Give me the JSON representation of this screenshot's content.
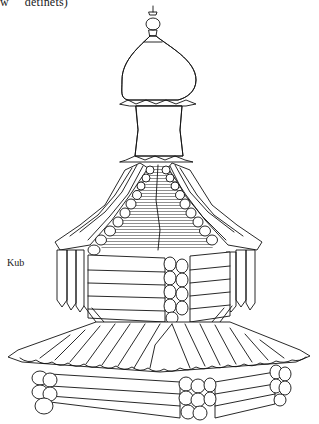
{
  "figure": {
    "caption_top": "w     detinets)",
    "labels": [
      {
        "id": "kub",
        "text": "Kub"
      }
    ],
    "colors": {
      "ink": "#111111",
      "paper": "#ffffff"
    }
  }
}
